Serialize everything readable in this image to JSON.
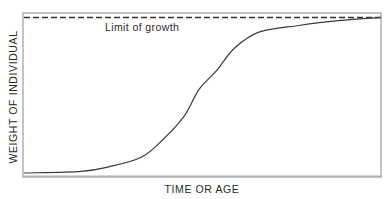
{
  "chart_data": {
    "type": "line",
    "title": "",
    "xlabel": "TIME OR AGE",
    "ylabel": "WEIGHT OF INDIVIDUAL",
    "grid": false,
    "legend": null,
    "annotations": [
      {
        "text": "Limit of growth",
        "target": "dashed horizontal asymptote line at top of plot"
      }
    ],
    "xlim": [
      0,
      1
    ],
    "ylim": [
      0,
      1
    ],
    "series": [
      {
        "name": "growth curve",
        "style": "solid",
        "x": [
          0.0,
          0.16,
          0.24,
          0.33,
          0.39,
          0.45,
          0.49,
          0.54,
          0.59,
          0.66,
          0.77,
          0.88,
          1.0
        ],
        "y": [
          0.0,
          0.01,
          0.04,
          0.1,
          0.21,
          0.36,
          0.52,
          0.64,
          0.78,
          0.88,
          0.92,
          0.95,
          0.97
        ]
      },
      {
        "name": "Limit of growth",
        "style": "dashed",
        "x": [
          0.0,
          1.0
        ],
        "y": [
          0.97,
          0.97
        ]
      }
    ]
  },
  "plot": {
    "frame": {
      "left": 23,
      "top": 13,
      "right": 381,
      "bottom": 177
    },
    "line_color": "#3a3a3a",
    "frame_color": "#8a8a8a"
  }
}
